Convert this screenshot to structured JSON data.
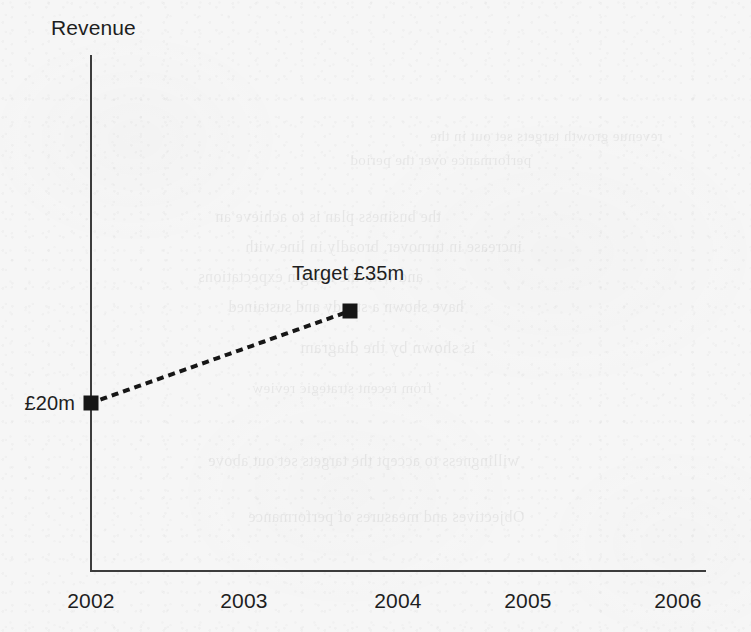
{
  "chart_data": {
    "type": "line",
    "title": "",
    "subtitle": "",
    "xlabel": "",
    "ylabel": "Revenue",
    "grid": false,
    "legend": false,
    "axis_color": "#3c3c3c",
    "marker_color": "#161616",
    "line_style": "dotted",
    "marker_style": "square",
    "x_tick_labels": [
      "2002",
      "2003",
      "2004",
      "2005",
      "2006"
    ],
    "xlim": [
      "2002",
      "2006"
    ],
    "y_axis_ticks_shown": false,
    "points": [
      {
        "x": "2002",
        "x_value": 2002,
        "y_value": 20,
        "label": "£20m",
        "label_position": "left",
        "units": "£m"
      },
      {
        "x": "2003.7",
        "x_value": 2003.7,
        "y_value": 35,
        "label": "Target £35m",
        "label_position": "above",
        "units": "£m"
      }
    ],
    "annotations": [
      {
        "text": "Revenue",
        "role": "y-axis-title"
      },
      {
        "text": "£20m",
        "role": "data-label"
      },
      {
        "text": "Target £35m",
        "role": "data-label"
      }
    ]
  },
  "background_bleed": [
    {
      "text": "revenue growth targets set out in the",
      "top": 128,
      "left": 430,
      "size": 15
    },
    {
      "text": "performance over the period",
      "top": 152,
      "left": 350,
      "size": 15
    },
    {
      "text": "the business plan is to achieve an",
      "top": 208,
      "left": 215,
      "size": 16
    },
    {
      "text": "increase in turnover, broadly in line with",
      "top": 238,
      "left": 245,
      "size": 16
    },
    {
      "text": "and with the margin expectations",
      "top": 268,
      "left": 198,
      "size": 16
    },
    {
      "text": "have shown a steady and sustained",
      "top": 298,
      "left": 228,
      "size": 16
    },
    {
      "text": "is shown by the diagram",
      "top": 338,
      "left": 300,
      "size": 17
    },
    {
      "text": "from recent strategic review",
      "top": 380,
      "left": 252,
      "size": 15
    },
    {
      "text": "willingness to accept the targets set out above",
      "top": 452,
      "left": 208,
      "size": 16
    },
    {
      "text": "Objectives and measures of performance",
      "top": 508,
      "left": 248,
      "size": 16
    }
  ]
}
